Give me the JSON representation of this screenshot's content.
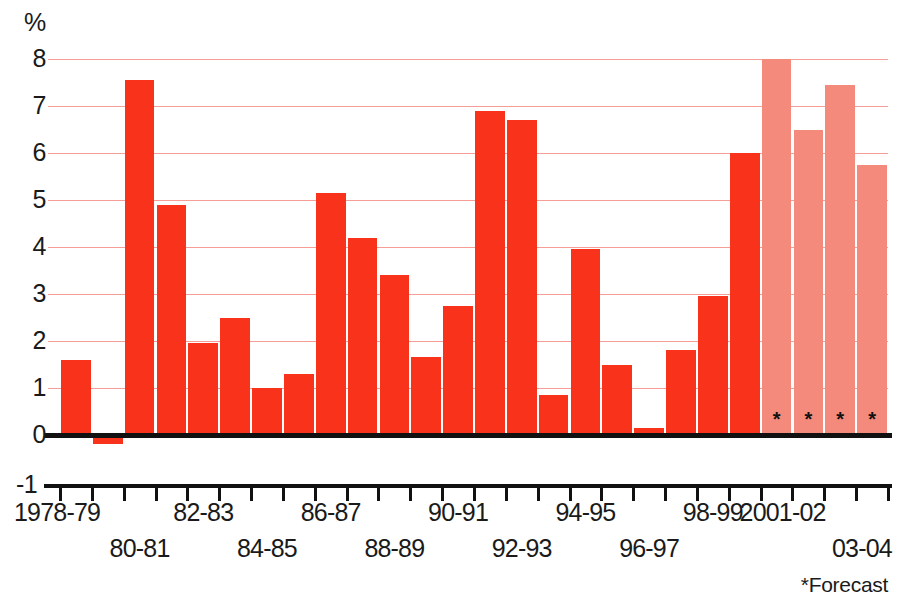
{
  "chart_data": {
    "type": "bar",
    "title": "",
    "xlabel": "",
    "ylabel": "%",
    "ylim": [
      -1,
      8
    ],
    "ytick_values": [
      -1,
      0,
      1,
      2,
      3,
      4,
      5,
      6,
      7,
      8
    ],
    "ytick_labels": [
      "-1",
      "0",
      "1",
      "2",
      "3",
      "4",
      "5",
      "6",
      "7",
      "8"
    ],
    "grid": true,
    "grid_values": [
      1,
      2,
      3,
      4,
      5,
      6,
      7,
      8
    ],
    "legend_position": "none",
    "categories": [
      "1978-79",
      "79-80",
      "80-81",
      "81-82",
      "82-83",
      "83-84",
      "84-85",
      "85-86",
      "86-87",
      "87-88",
      "88-89",
      "89-90",
      "90-91",
      "91-92",
      "92-93",
      "93-94",
      "94-95",
      "95-96",
      "96-97",
      "97-98",
      "98-99",
      "99-00",
      "2000-01",
      "2001-02",
      "02-03",
      "03-04"
    ],
    "values": [
      1.6,
      -0.2,
      7.55,
      4.9,
      1.95,
      2.5,
      1.0,
      1.3,
      5.15,
      4.2,
      3.4,
      1.65,
      2.75,
      6.9,
      6.7,
      0.85,
      3.95,
      1.5,
      0.15,
      1.8,
      2.95,
      6.0,
      8.0,
      6.5,
      7.45,
      5.75
    ],
    "series": [
      {
        "name": "Actual",
        "values": [
          1.6,
          -0.2,
          7.55,
          4.9,
          1.95,
          2.5,
          1.0,
          1.3,
          5.15,
          4.2,
          3.4,
          1.65,
          2.75,
          6.9,
          6.7,
          0.85,
          3.95,
          1.5,
          0.15,
          1.8,
          2.95,
          6.0,
          null,
          null,
          null,
          null
        ]
      },
      {
        "name": "Forecast",
        "values": [
          null,
          null,
          null,
          null,
          null,
          null,
          null,
          null,
          null,
          null,
          null,
          null,
          null,
          null,
          null,
          null,
          null,
          null,
          null,
          null,
          null,
          null,
          8.0,
          6.5,
          7.45,
          5.75
        ]
      }
    ],
    "forecast_start_index": 22,
    "forecast_marker": "*",
    "annotations": [
      "*Forecast"
    ],
    "visible_xtick_labels_row1": [
      "1978-79",
      "82-83",
      "86-87",
      "90-91",
      "94-95",
      "98-99",
      "2001-02"
    ],
    "visible_xtick_labels_row2": [
      "80-81",
      "84-85",
      "88-89",
      "92-93",
      "96-97",
      "03-04"
    ],
    "colors": {
      "actual_bar": "#f9321b",
      "forecast_bar": "#f38a7b",
      "gridline": "#f59d96",
      "axis": "#111111",
      "text": "#1a1a1a",
      "background": "#ffffff"
    }
  },
  "footnote": {
    "text": "*Forecast"
  },
  "axis": {
    "unit": "%",
    "neg_one": "-1"
  }
}
